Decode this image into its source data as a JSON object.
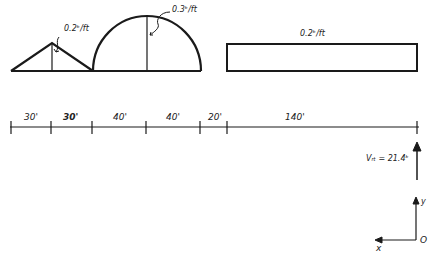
{
  "loads": {
    "triangle": {
      "label": "0.2ᵏ/ft"
    },
    "semicircle": {
      "label": "0.3ᵏ/ft"
    },
    "rectangle": {
      "label": "0.2ᵏ/ft"
    }
  },
  "dimensions": [
    {
      "label": "30'"
    },
    {
      "label": "30'"
    },
    {
      "label": "40'"
    },
    {
      "label": "40'"
    },
    {
      "label": "20'"
    },
    {
      "label": "140'"
    }
  ],
  "reaction": {
    "label": "Vᵣₜ = 21.4ᵏ"
  },
  "axes": {
    "x_label": "x",
    "y_label": "y",
    "origin_label": "O"
  },
  "colors": {
    "ink": "#1a1a1a",
    "background": "#ffffff"
  }
}
